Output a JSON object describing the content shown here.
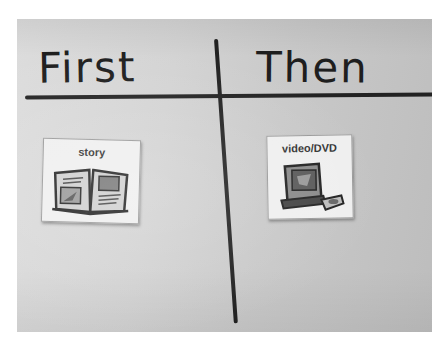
{
  "board": {
    "left_heading": "First",
    "right_heading": "Then"
  },
  "cards": [
    {
      "label": "story",
      "icon": "open-book-icon",
      "column": "First"
    },
    {
      "label": "video/DVD",
      "icon": "television-dvd-icon",
      "column": "Then"
    }
  ],
  "colors": {
    "board_background": "#d0d0d0",
    "marker": "#222222",
    "card_background": "#efefef"
  }
}
